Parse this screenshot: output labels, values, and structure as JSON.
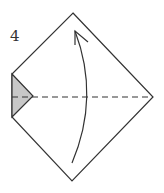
{
  "diagram": {
    "type": "origami-fold-step",
    "step_number": "4",
    "instruction": "Valley fold bottom half up along the horizontal diagonal",
    "colors": {
      "line": "#333333",
      "shade": "#c8c8c8",
      "paper": "#ffffff"
    },
    "outline_points": "73,13 153,97 72,181 12,117 12,74",
    "shaded_triangle_points": "12,74 33,96 12,117",
    "fold_line": {
      "x1": 12,
      "y1": 97,
      "x2": 153,
      "y2": 97,
      "dash": "6,4"
    },
    "arrow_path": "M72,163 Q100,97 75,31",
    "arrowhead_path": "M75,45 L75,31 L88,42"
  }
}
